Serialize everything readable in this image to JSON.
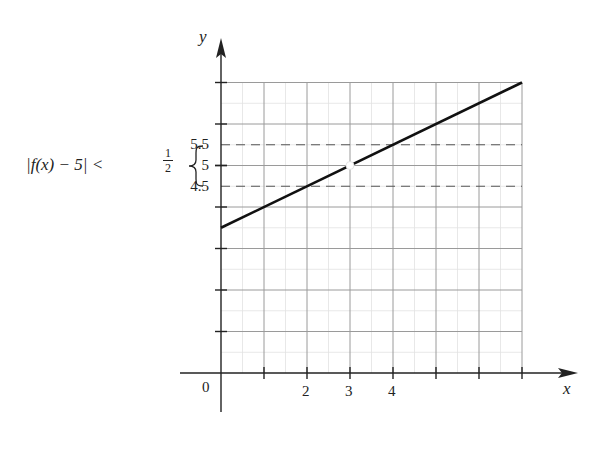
{
  "chart_data": {
    "type": "line",
    "title": "",
    "xlabel": "x",
    "ylabel": "y",
    "xlim": [
      0,
      7
    ],
    "ylim": [
      0,
      7
    ],
    "grid": true,
    "x_ticks": [
      1,
      2,
      3,
      4,
      5,
      6,
      7
    ],
    "x_tick_labels": {
      "0": "0",
      "2": "2",
      "3": "3",
      "4": "4"
    },
    "y_ticks": [
      1,
      2,
      3,
      4,
      5,
      6,
      7
    ],
    "y_tick_labels": {
      "4.5": "4.5",
      "5": "5",
      "5.5": "5.5"
    },
    "series": [
      {
        "name": "f(x)",
        "x": [
          0,
          7
        ],
        "y": [
          3.5,
          7
        ],
        "style": "solid",
        "color": "#111111"
      }
    ],
    "open_points": [
      {
        "x": 3,
        "y": 5
      }
    ],
    "reference_lines": [
      {
        "axis": "y",
        "value": 5.5,
        "style": "dashed"
      },
      {
        "axis": "y",
        "value": 4.5,
        "style": "dashed"
      }
    ],
    "annotations": [
      {
        "text": "|f(x) − 5| < 1/2",
        "brace_over": [
          4.5,
          5.5
        ]
      }
    ]
  },
  "labels": {
    "y_axis": "y",
    "x_axis": "x",
    "origin": "0",
    "x2": "2",
    "x3": "3",
    "x4": "4",
    "y55": "5.5",
    "y5": "5",
    "y45": "4.5",
    "inequality_left": "|f(x) − 5| <",
    "frac_num": "1",
    "frac_den": "2"
  }
}
